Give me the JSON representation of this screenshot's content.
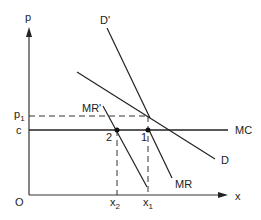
{
  "diagram": {
    "type": "monopoly pricing diagram",
    "axes": {
      "y_label": "p",
      "x_label": "x",
      "origin_label": "O"
    },
    "y_ticks": {
      "p1": {
        "main": "p",
        "sub": "1"
      },
      "c": "c"
    },
    "x_ticks": {
      "x2": {
        "main": "x",
        "sub": "2"
      },
      "x1": {
        "main": "x",
        "sub": "1"
      }
    },
    "curves": {
      "d_prime": "D'",
      "d": "D",
      "mr_prime": "MR'",
      "mr": "MR",
      "mc": "MC"
    },
    "points": {
      "point1": "1",
      "point2": "2"
    },
    "colors": {
      "line": "#222222",
      "background": "#ffffff"
    }
  }
}
